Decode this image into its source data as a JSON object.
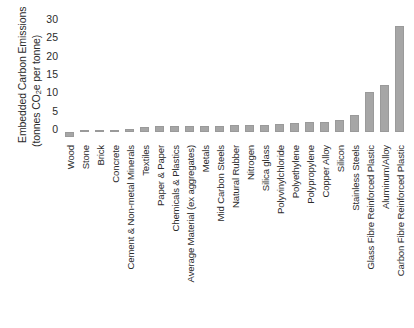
{
  "chart_data": {
    "type": "bar",
    "title": "",
    "xlabel": "",
    "ylabel": "Embedded Carbon Emissions (tonnes CO2e per tonne)",
    "ylabel_line1": "Embedded Carbon Emissions",
    "ylabel_line2_pre": "(tonnes CO",
    "ylabel_line2_sub": "2",
    "ylabel_line2_post": "e per tonne)",
    "ylim": [
      -2,
      30
    ],
    "ytick_labels": [
      "30",
      "25",
      "20",
      "15",
      "10",
      "5",
      "0"
    ],
    "ytick_values": [
      30,
      25,
      20,
      15,
      10,
      5,
      0
    ],
    "grid": false,
    "legend": "none",
    "bar_color": "#a6a6a6",
    "categories": [
      "Wood",
      "Stone",
      "Brick",
      "Concrete",
      "Cement & Non-metal Minerals",
      "Textiles",
      "Paper & Paper",
      "Chemicals & Plastics",
      "Average Material (ex aggregates)",
      "Metals",
      "Mid Carbon Steels",
      "Natural Rubber",
      "Nitrogen",
      "Silica glass",
      "Polyvinylchloride",
      "Polyethylene",
      "Polypropylene",
      "Copper Alloy",
      "Silicon",
      "Stainless Steels",
      "Glass Fibre Reinforced Plastic",
      "Aluminum/Alloy",
      "Carbon Fibre Reinforced Plastic"
    ],
    "values": [
      -1.5,
      0.1,
      0.2,
      0.3,
      0.8,
      1.4,
      1.5,
      1.6,
      1.6,
      1.6,
      1.7,
      1.8,
      1.9,
      2.0,
      2.2,
      2.3,
      2.6,
      2.8,
      3.2,
      4.5,
      11.0,
      12.8,
      29.0
    ]
  }
}
